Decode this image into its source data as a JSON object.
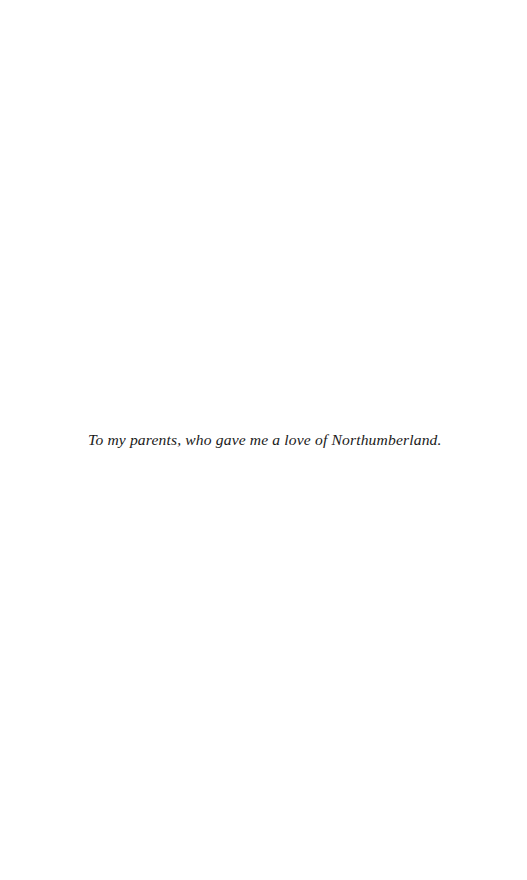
{
  "page": {
    "background_color": "#ffffff",
    "width": 527,
    "height": 880,
    "kind": "book-dedication-page"
  },
  "dedication": {
    "text": "To my parents, who gave me a love of Northumberland.",
    "style": "italic-serif",
    "text_color": "#1a1a1a",
    "alignment": "left"
  }
}
